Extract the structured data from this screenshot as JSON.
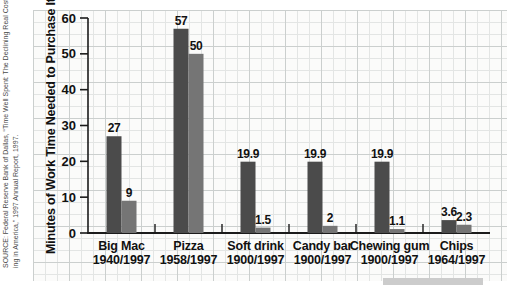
{
  "source_note": {
    "line1": "SOURCE: Federal Reserve Bank of Dallas, “Time Well Spent: The Declining Real Cost of Liv-",
    "line2": "ing in America,” 1997 Annual Report, 1997."
  },
  "chart_data": {
    "type": "bar",
    "title": "",
    "ylabel": "Minutes of Work Time Needed to Purchase Items",
    "xlabel": "",
    "ylim": [
      0,
      60
    ],
    "yticks": [
      0,
      10,
      20,
      30,
      40,
      50,
      60
    ],
    "grid": "graph-paper",
    "legend": "none",
    "categories": [
      {
        "line1": "Big Mac",
        "line2": "1940/1997"
      },
      {
        "line1": "Pizza",
        "line2": "1958/1997"
      },
      {
        "line1": "Soft drink",
        "line2": "1900/1997"
      },
      {
        "line1": "Candy bar",
        "line2": "1900/1997"
      },
      {
        "line1": "Chewing gum",
        "line2": "1900/1997"
      },
      {
        "line1": "Chips",
        "line2": "1964/1997"
      }
    ],
    "series": [
      {
        "name": "earlier-year",
        "color": "#4b4b4b",
        "values": [
          27,
          57,
          19.9,
          19.9,
          19.9,
          3.6
        ],
        "labels": [
          "27",
          "57",
          "19.9",
          "19.9",
          "19.9",
          "3.6"
        ]
      },
      {
        "name": "1997",
        "color": "#757575",
        "values": [
          9,
          50,
          1.5,
          2,
          1.1,
          2.3
        ],
        "labels": [
          "9",
          "50",
          "1.5",
          "2",
          "1.1",
          "2.3"
        ]
      }
    ]
  },
  "colors": {
    "panel_bg": "#fbfbfa",
    "grid_minor": "#e3e5e4",
    "grid_major": "#cbcfce",
    "axis": "#1b1b1b",
    "text": "#111111",
    "footer_bar": "#cccccc"
  }
}
